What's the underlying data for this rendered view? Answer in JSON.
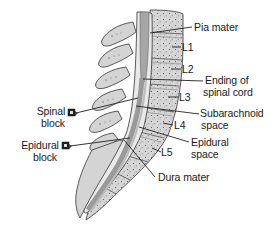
{
  "diagram": {
    "vertebrae": [
      "L1",
      "L2",
      "L3",
      "L4",
      "L5"
    ],
    "labels": {
      "pia_mater": "Pia mater",
      "l1": "L1",
      "l2": "L2",
      "ending_line1": "Ending of",
      "ending_line2": "spinal cord",
      "l3": "L3",
      "subarachnoid_line1": "Subarachnoid",
      "subarachnoid_line2": "space",
      "l4": "L4",
      "epidural_space_line1": "Epidural",
      "epidural_space_line2": "space",
      "l5": "L5",
      "dura_mater": "Dura mater",
      "spinal_block_line1": "Spinal",
      "spinal_block_line2": "block",
      "epidural_block_line1": "Epidural",
      "epidural_block_line2": "block"
    },
    "colors": {
      "bone": "#d8d8d8",
      "bone_dark": "#bdbdbd",
      "cord": "#a9a9a9",
      "csf": "#e8e8e8",
      "outline": "#333333",
      "text": "#1a1a1a"
    }
  }
}
